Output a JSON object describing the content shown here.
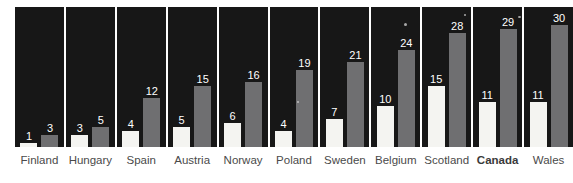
{
  "chart_data": {
    "type": "bar",
    "title": "",
    "subtitle": "",
    "xlabel": "",
    "ylabel": "",
    "ylim": [
      0,
      34
    ],
    "grid": false,
    "legend_position": "none",
    "categories": [
      "Finland",
      "Hungary",
      "Spain",
      "Austria",
      "Norway",
      "Poland",
      "Sweden",
      "Belgium",
      "Scotland",
      "Canada",
      "Wales"
    ],
    "highlight_category": "Canada",
    "series": [
      {
        "name": "white",
        "color": "#f4f4f1",
        "values": [
          1,
          3,
          4,
          5,
          6,
          4,
          7,
          10,
          15,
          11,
          11
        ]
      },
      {
        "name": "gray",
        "color": "#6f6f71",
        "values": [
          3,
          5,
          12,
          15,
          16,
          19,
          21,
          24,
          28,
          29,
          30
        ]
      }
    ],
    "panel_background": "#171717",
    "value_label_color": "#ffffff",
    "category_label_color": "#4a4a4a"
  }
}
